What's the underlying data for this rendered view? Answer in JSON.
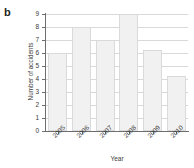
{
  "panel": {
    "label": "b"
  },
  "chart_data": {
    "type": "bar",
    "title": "",
    "xlabel": "Year",
    "ylabel": "Number of accidents",
    "categories": [
      "2005",
      "2006",
      "2007",
      "2008",
      "2009",
      "2010"
    ],
    "values": [
      6,
      8,
      7,
      9,
      6.2,
      4.2
    ],
    "ylim": [
      0,
      9
    ],
    "yticks": [
      "0",
      "1",
      "2",
      "3",
      "4",
      "5",
      "6",
      "7",
      "8",
      "9"
    ],
    "grid": true,
    "legend": "none",
    "bar_fill": "#f1f1f1",
    "bar_border": "#dadada",
    "axis_color": "#6e6e6e"
  }
}
